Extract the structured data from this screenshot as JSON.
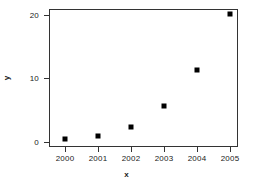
{
  "chart_data": {
    "type": "scatter",
    "title": "",
    "xlabel": "x",
    "ylabel": "y",
    "x": [
      2000,
      2001,
      2002,
      2003,
      2004,
      2005
    ],
    "values": [
      0.5,
      1.0,
      2.4,
      5.6,
      11.3,
      20.2
    ],
    "series": [
      {
        "name": "",
        "points": [
          {
            "x": 2000,
            "y": 0.5
          },
          {
            "x": 2001,
            "y": 1.0
          },
          {
            "x": 2002,
            "y": 2.4
          },
          {
            "x": 2003,
            "y": 5.6
          },
          {
            "x": 2004,
            "y": 11.3
          },
          {
            "x": 2005,
            "y": 20.2
          }
        ]
      }
    ],
    "xticks": [
      "2000",
      "2001",
      "2002",
      "2003",
      "2004",
      "2005"
    ],
    "yticks": [
      "0",
      "10",
      "20"
    ],
    "ytick_values": [
      0,
      10,
      20
    ],
    "xlim": [
      1999.7,
      2005.4
    ],
    "ylim": [
      -0.6,
      21.2
    ],
    "grid": false,
    "legend": false,
    "marker": "filled-square",
    "marker_color": "#000000",
    "frame_color": "#333333",
    "background": "#ffffff"
  }
}
